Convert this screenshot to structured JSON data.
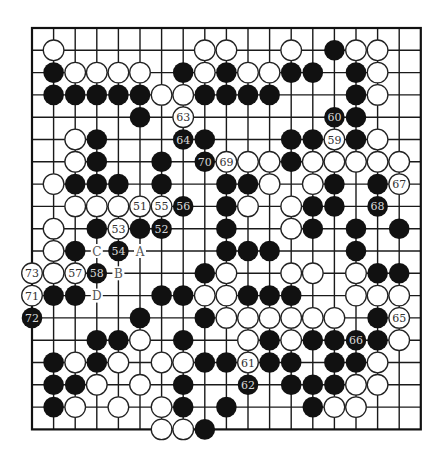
{
  "board": {
    "size": 19,
    "origin_x": 32,
    "origin_y": 28,
    "spacing_x": 21.6,
    "spacing_y": 22.3,
    "stone_radius": 10.3,
    "colors": {
      "black": "#111111",
      "white": "#ffffff",
      "line": "#1a1a1a",
      "background": "#ffffff"
    }
  },
  "stones": {
    "black": [
      [
        14,
        1
      ],
      [
        1,
        2
      ],
      [
        7,
        2
      ],
      [
        9,
        2
      ],
      [
        12,
        2
      ],
      [
        13,
        2
      ],
      [
        15,
        2
      ],
      [
        1,
        3
      ],
      [
        2,
        3
      ],
      [
        3,
        3
      ],
      [
        4,
        3
      ],
      [
        5,
        3
      ],
      [
        8,
        3
      ],
      [
        9,
        3
      ],
      [
        10,
        3
      ],
      [
        11,
        3
      ],
      [
        15,
        3
      ],
      [
        5,
        4
      ],
      [
        15,
        4
      ],
      [
        3,
        5
      ],
      [
        8,
        5
      ],
      [
        12,
        5
      ],
      [
        13,
        5
      ],
      [
        15,
        5
      ],
      [
        3,
        6
      ],
      [
        6,
        6
      ],
      [
        12,
        6
      ],
      [
        2,
        7
      ],
      [
        3,
        7
      ],
      [
        4,
        7
      ],
      [
        6,
        7
      ],
      [
        9,
        7
      ],
      [
        10,
        7
      ],
      [
        14,
        7
      ],
      [
        16,
        7
      ],
      [
        9,
        8
      ],
      [
        13,
        8
      ],
      [
        14,
        8
      ],
      [
        3,
        9
      ],
      [
        5,
        9
      ],
      [
        9,
        9
      ],
      [
        13,
        9
      ],
      [
        15,
        9
      ],
      [
        17,
        9
      ],
      [
        2,
        10
      ],
      [
        9,
        10
      ],
      [
        10,
        10
      ],
      [
        11,
        10
      ],
      [
        15,
        10
      ],
      [
        8,
        11
      ],
      [
        16,
        11
      ],
      [
        17,
        11
      ],
      [
        1,
        12
      ],
      [
        2,
        12
      ],
      [
        6,
        12
      ],
      [
        7,
        12
      ],
      [
        10,
        12
      ],
      [
        11,
        12
      ],
      [
        12,
        12
      ],
      [
        5,
        13
      ],
      [
        8,
        13
      ],
      [
        16,
        13
      ],
      [
        3,
        14
      ],
      [
        4,
        14
      ],
      [
        7,
        14
      ],
      [
        11,
        14
      ],
      [
        13,
        14
      ],
      [
        14,
        14
      ],
      [
        16,
        14
      ],
      [
        1,
        15
      ],
      [
        3,
        15
      ],
      [
        8,
        15
      ],
      [
        9,
        15
      ],
      [
        11,
        15
      ],
      [
        12,
        15
      ],
      [
        14,
        15
      ],
      [
        15,
        15
      ],
      [
        1,
        16
      ],
      [
        2,
        16
      ],
      [
        7,
        16
      ],
      [
        12,
        16
      ],
      [
        13,
        16
      ],
      [
        14,
        16
      ],
      [
        1,
        17
      ],
      [
        7,
        17
      ],
      [
        9,
        17
      ],
      [
        13,
        17
      ],
      [
        8,
        18
      ]
    ],
    "white": [
      [
        1,
        1
      ],
      [
        8,
        1
      ],
      [
        9,
        1
      ],
      [
        12,
        1
      ],
      [
        15,
        1
      ],
      [
        16,
        1
      ],
      [
        2,
        2
      ],
      [
        3,
        2
      ],
      [
        4,
        2
      ],
      [
        5,
        2
      ],
      [
        8,
        2
      ],
      [
        10,
        2
      ],
      [
        11,
        2
      ],
      [
        16,
        2
      ],
      [
        6,
        3
      ],
      [
        7,
        3
      ],
      [
        16,
        3
      ],
      [
        2,
        5
      ],
      [
        16,
        5
      ],
      [
        2,
        6
      ],
      [
        10,
        6
      ],
      [
        11,
        6
      ],
      [
        13,
        6
      ],
      [
        14,
        6
      ],
      [
        15,
        6
      ],
      [
        16,
        6
      ],
      [
        17,
        6
      ],
      [
        1,
        7
      ],
      [
        11,
        7
      ],
      [
        13,
        7
      ],
      [
        2,
        8
      ],
      [
        3,
        8
      ],
      [
        4,
        8
      ],
      [
        10,
        8
      ],
      [
        12,
        8
      ],
      [
        1,
        9
      ],
      [
        12,
        9
      ],
      [
        1,
        10
      ],
      [
        1,
        11
      ],
      [
        9,
        11
      ],
      [
        12,
        11
      ],
      [
        13,
        11
      ],
      [
        15,
        11
      ],
      [
        8,
        12
      ],
      [
        9,
        12
      ],
      [
        15,
        12
      ],
      [
        16,
        12
      ],
      [
        17,
        12
      ],
      [
        9,
        13
      ],
      [
        10,
        13
      ],
      [
        11,
        13
      ],
      [
        12,
        13
      ],
      [
        13,
        13
      ],
      [
        14,
        13
      ],
      [
        5,
        14
      ],
      [
        10,
        14
      ],
      [
        12,
        14
      ],
      [
        17,
        14
      ],
      [
        2,
        15
      ],
      [
        4,
        15
      ],
      [
        6,
        15
      ],
      [
        7,
        15
      ],
      [
        16,
        15
      ],
      [
        3,
        16
      ],
      [
        5,
        16
      ],
      [
        15,
        16
      ],
      [
        16,
        16
      ],
      [
        2,
        17
      ],
      [
        4,
        17
      ],
      [
        6,
        17
      ],
      [
        14,
        17
      ],
      [
        15,
        17
      ],
      [
        6,
        18
      ],
      [
        7,
        18
      ]
    ]
  },
  "numbered_moves": [
    {
      "n": "51",
      "color": "white",
      "col": 5,
      "row": 8
    },
    {
      "n": "52",
      "color": "black",
      "col": 6,
      "row": 9
    },
    {
      "n": "53",
      "color": "white",
      "col": 4,
      "row": 9
    },
    {
      "n": "54",
      "color": "black",
      "col": 4,
      "row": 10
    },
    {
      "n": "55",
      "color": "white",
      "col": 6,
      "row": 8
    },
    {
      "n": "56",
      "color": "black",
      "col": 7,
      "row": 8
    },
    {
      "n": "57",
      "color": "white",
      "col": 2,
      "row": 11
    },
    {
      "n": "58",
      "color": "black",
      "col": 3,
      "row": 11
    },
    {
      "n": "59",
      "color": "white",
      "col": 14,
      "row": 5
    },
    {
      "n": "60",
      "color": "black",
      "col": 14,
      "row": 4
    },
    {
      "n": "61",
      "color": "white",
      "col": 10,
      "row": 15
    },
    {
      "n": "62",
      "color": "black",
      "col": 10,
      "row": 16
    },
    {
      "n": "63",
      "color": "white",
      "col": 7,
      "row": 4
    },
    {
      "n": "64",
      "color": "black",
      "col": 7,
      "row": 5
    },
    {
      "n": "65",
      "color": "white",
      "col": 17,
      "row": 13
    },
    {
      "n": "66",
      "color": "black",
      "col": 15,
      "row": 14
    },
    {
      "n": "67",
      "color": "white",
      "col": 17,
      "row": 7
    },
    {
      "n": "68",
      "color": "black",
      "col": 16,
      "row": 8
    },
    {
      "n": "69",
      "color": "white",
      "col": 9,
      "row": 6
    },
    {
      "n": "70",
      "color": "black",
      "col": 8,
      "row": 6
    },
    {
      "n": "71",
      "color": "white",
      "col": 0,
      "row": 12
    },
    {
      "n": "72",
      "color": "black",
      "col": 0,
      "row": 13
    },
    {
      "n": "73",
      "color": "white",
      "col": 0,
      "row": 11
    }
  ],
  "letter_labels": [
    {
      "text": "A",
      "col": 5,
      "row": 10
    },
    {
      "text": "B",
      "col": 4,
      "row": 11
    },
    {
      "text": "C",
      "col": 3,
      "row": 10
    },
    {
      "text": "D",
      "col": 3,
      "row": 12
    }
  ]
}
